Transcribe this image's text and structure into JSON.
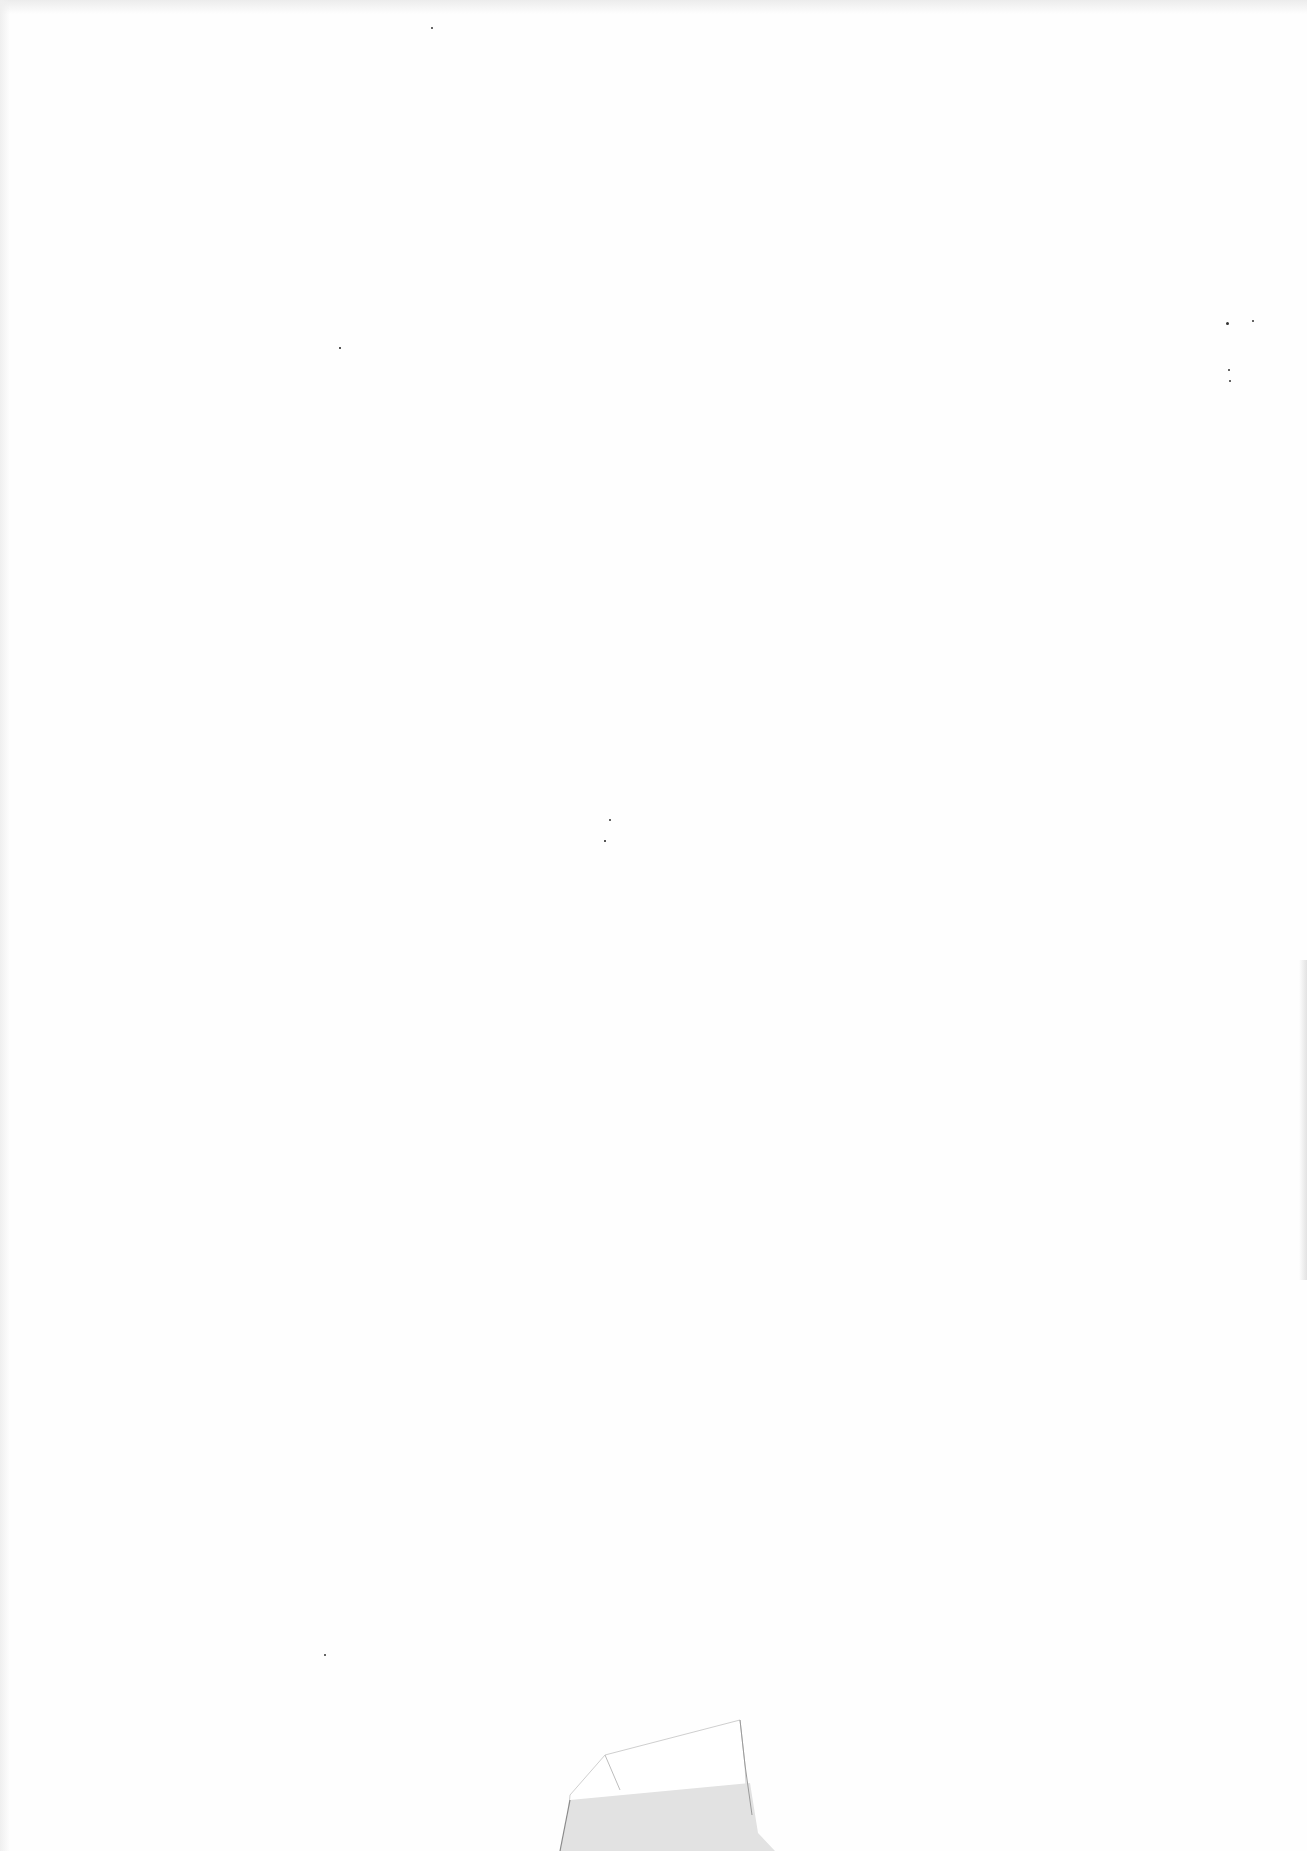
{
  "page": {
    "type": "blank-scanned-sheet",
    "background_color": "#fefefe",
    "text_content": ""
  },
  "artifacts": {
    "specks": [
      {
        "x": 1227,
        "y": 323,
        "r": 1.5
      },
      {
        "x": 1253,
        "y": 321,
        "r": 1
      },
      {
        "x": 1229,
        "y": 370,
        "r": 1
      },
      {
        "x": 1230,
        "y": 381,
        "r": 1
      },
      {
        "x": 610,
        "y": 820,
        "r": 1.2
      },
      {
        "x": 605,
        "y": 841,
        "r": 0.8
      },
      {
        "x": 325,
        "y": 1655,
        "r": 1
      },
      {
        "x": 432,
        "y": 28,
        "r": 1
      },
      {
        "x": 340,
        "y": 348,
        "r": 0.8
      }
    ],
    "tape_fill_color": "#e2e2e2",
    "tape_edge_color": "#9a9a9a"
  }
}
